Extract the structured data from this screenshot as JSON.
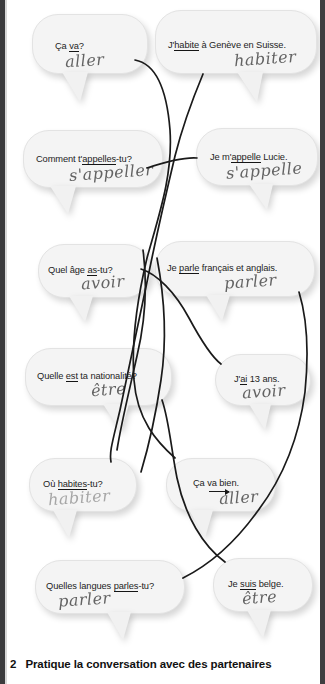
{
  "exercise": {
    "number": "2",
    "instruction": "Pratique la conversation avec des partenaires"
  },
  "colors": {
    "bubble_fill": "#f4f4f4",
    "bubble_border": "#e3e3e3",
    "text": "#1d1d1d",
    "handwriting": "#4a4a4a",
    "page_edge": "#3b3b3d"
  },
  "bubbles": [
    {
      "id": "ca-va",
      "side": "left",
      "text_before": "Ça ",
      "underlined": "va",
      "text_after": "?",
      "infinitive": "aller",
      "marker": "underline"
    },
    {
      "id": "jhabite-geneve",
      "side": "right",
      "text_before": "J'",
      "underlined": "habite",
      "text_after": " à Genève en Suisse.",
      "infinitive": "habiter",
      "marker": "underline"
    },
    {
      "id": "comment-tappelles-tu",
      "side": "left",
      "text_before": "Comment t'",
      "underlined": "appelles",
      "text_after": "-tu?",
      "infinitive": "s'appeller",
      "marker": "underline"
    },
    {
      "id": "je-mappelle-lucie",
      "side": "right",
      "text_before": "Je m'",
      "underlined": "appelle",
      "text_after": " Lucie.",
      "infinitive": "s'appelle",
      "marker": "underline"
    },
    {
      "id": "quel-age-as-tu",
      "side": "left",
      "text_before": "Quel âge ",
      "underlined": "as",
      "text_after": "-tu?",
      "infinitive": "avoir",
      "marker": "underline"
    },
    {
      "id": "je-parle-francais",
      "side": "right",
      "text_before": "Je ",
      "underlined": "parle",
      "text_after": " français et anglais.",
      "infinitive": "parler",
      "marker": "underline"
    },
    {
      "id": "quelle-nationalite",
      "side": "left",
      "text_before": "Quelle ",
      "underlined": "est",
      "text_after": " ta nationalité?",
      "infinitive": "être",
      "marker": "underline"
    },
    {
      "id": "jai-13-ans",
      "side": "right",
      "text_before": "J'",
      "underlined": "ai",
      "text_after": " 13 ans.",
      "infinitive": "avoir",
      "marker": "underline"
    },
    {
      "id": "ou-habites-tu",
      "side": "left",
      "text_before": "Où ",
      "underlined": "habites",
      "text_after": "-tu?",
      "infinitive": "habiter",
      "marker": "underline"
    },
    {
      "id": "ca-va-bien",
      "side": "right",
      "text_before": "Ça ",
      "underlined": "va",
      "text_after": " bien.",
      "infinitive": "aller",
      "marker": "arrow"
    },
    {
      "id": "quelles-langues-parles-tu",
      "side": "left",
      "text_before": "Quelles langues ",
      "underlined": "parles",
      "text_after": "-tu?",
      "infinitive": "parler",
      "marker": "underline"
    },
    {
      "id": "je-suis-belge",
      "side": "right",
      "text_before": "Je ",
      "underlined": "suis",
      "text_after": " belge.",
      "infinitive": "être",
      "marker": "underline"
    }
  ]
}
